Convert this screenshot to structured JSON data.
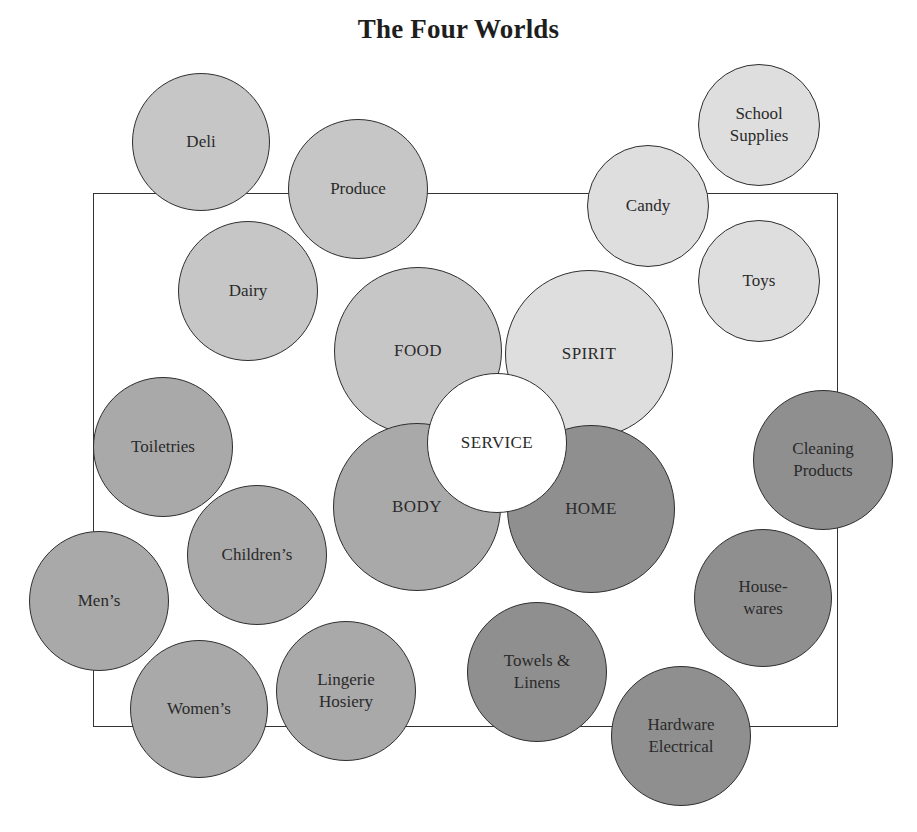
{
  "title": "The Four Worlds",
  "frame": {
    "left": 93,
    "top": 193,
    "width": 745,
    "height": 534,
    "stroke": "#333333"
  },
  "colors": {
    "food_group": "#c6c6c6",
    "spirit_group": "#dedede",
    "body_group": "#a9a9a9",
    "home_group": "#8f8f8f",
    "service": "#ffffff",
    "stroke": "#2f2f2f"
  },
  "core": {
    "service": {
      "label": "SERVICE",
      "cx": 497,
      "cy": 443,
      "r": 70,
      "fill": "#ffffff"
    }
  },
  "worlds": [
    {
      "id": "food",
      "label": "FOOD",
      "cx": 418,
      "cy": 351,
      "r": 84,
      "fill": "#c6c6c6"
    },
    {
      "id": "spirit",
      "label": "SPIRIT",
      "cx": 589,
      "cy": 354,
      "r": 84,
      "fill": "#dedede"
    },
    {
      "id": "body",
      "label": "BODY",
      "cx": 417,
      "cy": 507,
      "r": 84,
      "fill": "#a9a9a9"
    },
    {
      "id": "home",
      "label": "HOME",
      "cx": 591,
      "cy": 509,
      "r": 84,
      "fill": "#8f8f8f"
    }
  ],
  "departments": [
    {
      "id": "deli",
      "label": "Deli",
      "world": "food",
      "cx": 201,
      "cy": 142,
      "r": 69,
      "fill": "#c6c6c6"
    },
    {
      "id": "produce",
      "label": "Produce",
      "world": "food",
      "cx": 358,
      "cy": 189,
      "r": 70,
      "fill": "#c6c6c6"
    },
    {
      "id": "dairy",
      "label": "Dairy",
      "world": "food",
      "cx": 248,
      "cy": 291,
      "r": 70,
      "fill": "#c6c6c6"
    },
    {
      "id": "school-supplies",
      "label": "School\nSupplies",
      "world": "spirit",
      "cx": 759,
      "cy": 125,
      "r": 61,
      "fill": "#dedede"
    },
    {
      "id": "candy",
      "label": "Candy",
      "world": "spirit",
      "cx": 648,
      "cy": 206,
      "r": 61,
      "fill": "#dedede"
    },
    {
      "id": "toys",
      "label": "Toys",
      "world": "spirit",
      "cx": 759,
      "cy": 281,
      "r": 61,
      "fill": "#dedede"
    },
    {
      "id": "toiletries",
      "label": "Toiletries",
      "world": "body",
      "cx": 163,
      "cy": 447,
      "r": 70,
      "fill": "#a9a9a9"
    },
    {
      "id": "childrens",
      "label": "Children’s",
      "world": "body",
      "cx": 257,
      "cy": 555,
      "r": 70,
      "fill": "#a9a9a9"
    },
    {
      "id": "mens",
      "label": "Men’s",
      "world": "body",
      "cx": 99,
      "cy": 601,
      "r": 70,
      "fill": "#a9a9a9"
    },
    {
      "id": "womens",
      "label": "Women’s",
      "world": "body",
      "cx": 199,
      "cy": 709,
      "r": 69,
      "fill": "#a9a9a9"
    },
    {
      "id": "lingerie-hosiery",
      "label": "Lingerie\nHosiery",
      "world": "body",
      "cx": 346,
      "cy": 691,
      "r": 70,
      "fill": "#a9a9a9"
    },
    {
      "id": "cleaning-products",
      "label": "Cleaning\nProducts",
      "world": "home",
      "cx": 823,
      "cy": 460,
      "r": 70,
      "fill": "#8f8f8f"
    },
    {
      "id": "housewares",
      "label": "House-\nwares",
      "world": "home",
      "cx": 763,
      "cy": 598,
      "r": 69,
      "fill": "#8f8f8f"
    },
    {
      "id": "towels-linens",
      "label": "Towels &\nLinens",
      "world": "home",
      "cx": 537,
      "cy": 672,
      "r": 70,
      "fill": "#8f8f8f"
    },
    {
      "id": "hardware-electrical",
      "label": "Hardware\nElectrical",
      "world": "home",
      "cx": 681,
      "cy": 736,
      "r": 70,
      "fill": "#8f8f8f"
    }
  ]
}
